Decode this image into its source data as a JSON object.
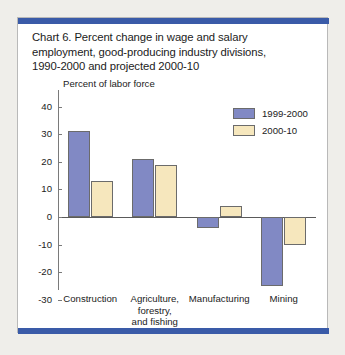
{
  "figure": {
    "title_lines": [
      "Chart 6. Percent change in wage and salary",
      "employment, good-producing industry divisions,",
      "1990-2000 and projected 2000-10"
    ],
    "accent_color": "#3a5ba8",
    "panel_background": "#ffffff",
    "page_background": "#efeeea"
  },
  "chart_data": {
    "type": "bar",
    "title": "Chart 6. Percent change in wage and salary employment, good-producing industry divisions, 1990-2000 and projected 2000-10",
    "subtitle": "",
    "xlabel": "",
    "ylabel": "Percent of labor force",
    "categories": [
      "Construction",
      "Agriculture, forestry, and fishing",
      "Manufacturing",
      "Mining"
    ],
    "category_label_lines": [
      [
        "Construction"
      ],
      [
        "Agriculture,",
        "forestry,",
        "and fishing"
      ],
      [
        "Manufacturing"
      ],
      [
        "Mining"
      ]
    ],
    "series": [
      {
        "name": "1999-2000",
        "color": "#8189c4",
        "values": [
          31,
          21,
          -4,
          -25
        ]
      },
      {
        "name": "2000-10",
        "color": "#f6e7bd",
        "values": [
          13,
          19,
          4,
          -10
        ]
      }
    ],
    "ylim": [
      -30,
      40
    ],
    "ytick_values": [
      40,
      30,
      20,
      10,
      0,
      -10,
      -20,
      -30
    ],
    "ytick_labels": [
      "40",
      "30",
      "20",
      "10",
      "0",
      "-10",
      "-20",
      "-30"
    ],
    "grid": false,
    "legend_position": "top-right"
  }
}
